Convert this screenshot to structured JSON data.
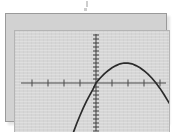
{
  "figure": {
    "title": "",
    "device": "graphing-calculator-screen",
    "frame_color": "#9a9a9a",
    "screen_color": "#d6d6d6",
    "curve_color": "#2a2a2a",
    "axis_color": "#4a4a4a"
  },
  "chart_data": {
    "type": "line",
    "title": "",
    "xlabel": "",
    "ylabel": "",
    "grid": false,
    "legend": null,
    "xlim": [
      -4.7,
      4.7
    ],
    "ylim": [
      -3.1,
      3.1
    ],
    "x_tick_step": 1,
    "y_tick_step": 0.25,
    "x_ticks": [
      -4,
      -3,
      -2,
      -1,
      1,
      2,
      3,
      4
    ],
    "y_ticks": [
      -3,
      -2.75,
      -2.5,
      -2.25,
      -2,
      -1.75,
      -1.5,
      -1.25,
      -1,
      -0.75,
      -0.5,
      -0.25,
      0.25,
      0.5,
      0.75,
      1,
      1.25,
      1.5,
      1.75,
      2,
      2.25,
      2.5,
      2.75,
      3
    ],
    "series": [
      {
        "name": "parabola",
        "shape": "downward-parabola",
        "vertex": [
          1.75,
          1.25
        ],
        "x_intercepts": [
          0,
          3.6
        ],
        "y_intercept": 0,
        "x": [
          -1.4,
          -1.2,
          -1.0,
          -0.8,
          -0.6,
          -0.4,
          -0.2,
          0.0,
          0.25,
          0.5,
          0.75,
          1.0,
          1.25,
          1.5,
          1.75,
          2.0,
          2.25,
          2.5,
          2.75,
          3.0,
          3.25,
          3.5,
          3.75,
          4.0,
          4.25,
          4.5,
          4.7
        ],
        "y": [
          -3.05,
          -2.52,
          -2.03,
          -1.57,
          -1.15,
          -0.77,
          -0.42,
          0.0,
          0.3,
          0.55,
          0.77,
          0.95,
          1.09,
          1.2,
          1.25,
          1.24,
          1.2,
          1.09,
          0.95,
          0.77,
          0.55,
          0.3,
          0.0,
          -0.34,
          -0.72,
          -1.13,
          -1.45
        ]
      }
    ]
  }
}
